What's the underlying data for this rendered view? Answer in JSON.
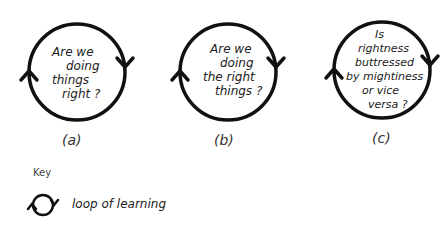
{
  "diagrams": [
    {
      "id": "a",
      "lines": [
        "Are we",
        "doing",
        "things",
        "right ?"
      ],
      "label": "(a)"
    },
    {
      "id": "b",
      "lines": [
        "Are we",
        "doing",
        "the right",
        "things ?"
      ],
      "label": "(b)"
    },
    {
      "id": "c",
      "lines": [
        "Is",
        "rightness",
        "buttressed",
        "by mightiness",
        "or vice",
        "versa ?"
      ],
      "label": "(c)"
    }
  ],
  "key": {
    "title": "Key",
    "icon": "loop-of-learning-icon",
    "text": "loop of learning"
  }
}
